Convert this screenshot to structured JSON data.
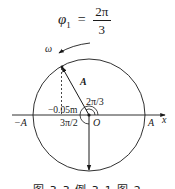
{
  "formula": {
    "symbol": "φ",
    "subscript": "1",
    "equals": "=",
    "numerator": "2π",
    "denominator": "3"
  },
  "labels": {
    "omega": "ω",
    "vector": "A",
    "angle1": "2π/3",
    "angle2": "3π/2",
    "projection": "−0.05m",
    "origin": "O",
    "neg_amplitude": "−A",
    "pos_amplitude": "A",
    "x_axis": "x"
  },
  "caption": "图 3-3  例 3-1 图 2",
  "geometry": {
    "center": [
      89,
      115
    ],
    "radius": 56,
    "vector_angle": "2π/3",
    "second_vector_angle": "3π/2"
  },
  "colors": {
    "stroke": "#1a1a1a",
    "background": "#ffffff"
  }
}
